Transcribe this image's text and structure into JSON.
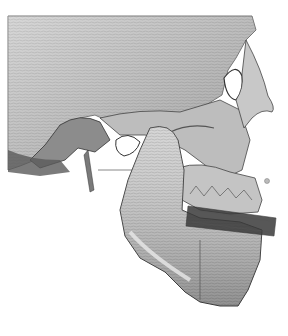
{
  "image": {
    "description": "3D CT surface rendering of a human skull, right lateral view",
    "view": "lateral",
    "colors": {
      "background": "#ffffff",
      "bone_light": "#d9d9d9",
      "bone_mid": "#a8a8a8",
      "bone_dark": "#4a4a4a",
      "splint": "#3a3a3a"
    }
  }
}
